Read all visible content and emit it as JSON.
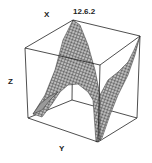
{
  "figure": {
    "id_label": "12.6.2",
    "axes": {
      "x": "X",
      "y": "Y",
      "z": "Z"
    }
  },
  "colors": {
    "mesh": "#333333",
    "box": "#222222",
    "background": "#ffffff"
  }
}
